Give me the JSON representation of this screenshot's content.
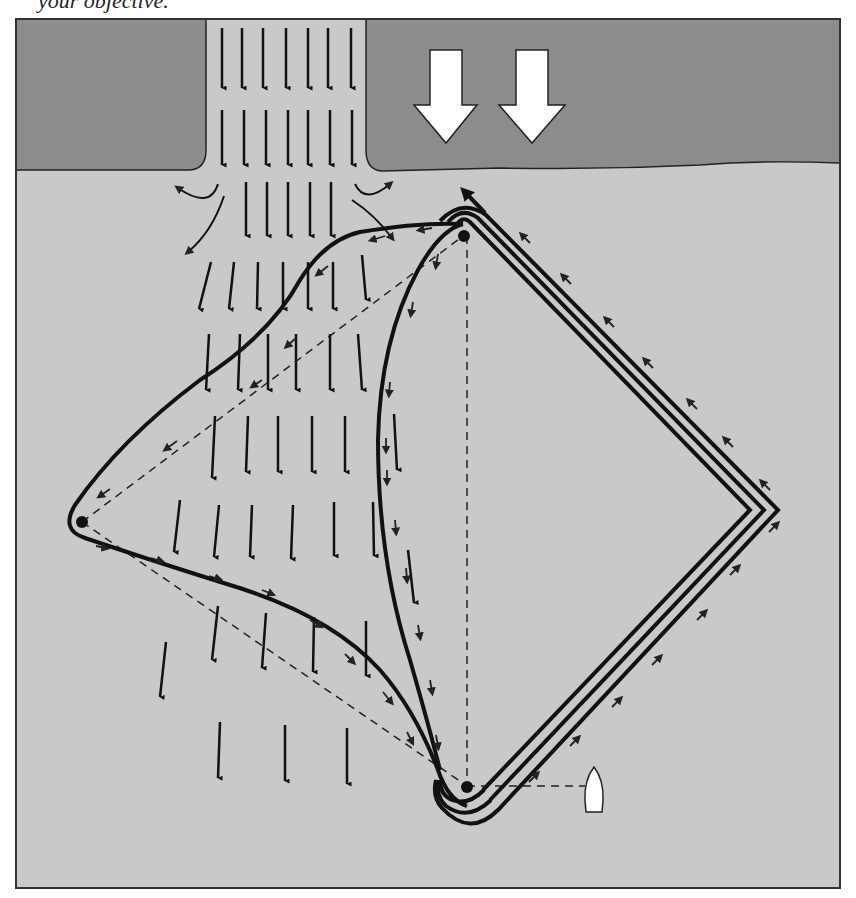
{
  "caption": {
    "text": "your objective."
  },
  "diagram": {
    "colors": {
      "land": "#8c8c8c",
      "water": "#c9c9c9",
      "ink": "#111111",
      "block_arrow": "#ffffff",
      "frame": "#333333"
    },
    "elements": {
      "land_left": "land-mass-left",
      "land_right": "land-mass-right",
      "channel": "current-channel",
      "wind_arrows": [
        "wind-arrow-1",
        "wind-arrow-2"
      ],
      "marks": [
        "windward-mark",
        "wing-mark",
        "leeward-mark"
      ],
      "boat": "boat",
      "courses": [
        "course-through-current",
        "course-inside-current",
        "course-outside-current"
      ]
    },
    "legend": {
      "white_arrows": "wind direction",
      "long_black_arrows": "tidal current",
      "small_arrows": "direction of sailing",
      "dashed_lines": "rhumb lines between marks",
      "solid_lines": "sailed courses"
    }
  }
}
